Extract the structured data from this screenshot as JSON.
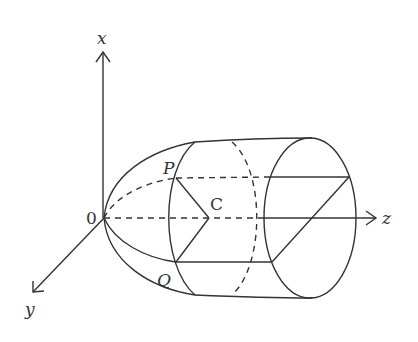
{
  "diagram": {
    "axes": {
      "x_label": "x",
      "y_label": "y",
      "z_label": "z",
      "origin_label": "0"
    },
    "points": {
      "P": "P",
      "Q": "Q",
      "C": "C"
    },
    "colors": {
      "stroke": "#333333",
      "background": "#ffffff"
    }
  }
}
